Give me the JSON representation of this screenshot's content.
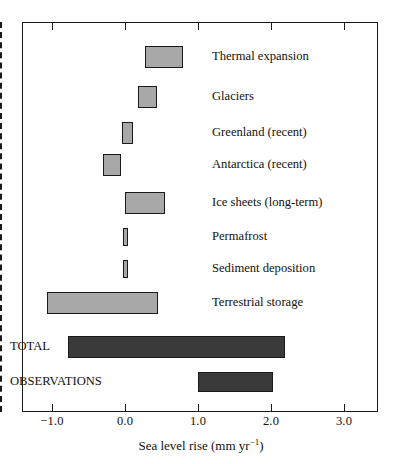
{
  "chart_data": {
    "type": "bar",
    "orientation": "horizontal",
    "subtype": "range-bars",
    "title": "",
    "xlabel": "Sea level rise (mm yr−1)",
    "ylabel": "",
    "xlim": [
      -1.45,
      3.45
    ],
    "xticks": [
      -1.0,
      0.0,
      1.0,
      2.0,
      3.0
    ],
    "xticklabels": [
      "−1.0",
      "0.0",
      "1.0",
      "2.0",
      "3.0"
    ],
    "grid": false,
    "legend": null,
    "zero_reference_line": {
      "value": 0.0,
      "style": "dashed"
    },
    "categories": [
      "Thermal expansion",
      "Glaciers",
      "Greenland (recent)",
      "Antarctica (recent)",
      "Ice sheets (long-term)",
      "Permafrost",
      "Sediment deposition",
      "Terrestrial storage",
      "TOTAL",
      "OBSERVATIONS"
    ],
    "bars": [
      {
        "label": "Thermal expansion",
        "low": 0.27,
        "high": 0.79,
        "color": "#a8a8a8",
        "label_position": "right"
      },
      {
        "label": "Glaciers",
        "low": 0.18,
        "high": 0.44,
        "color": "#a8a8a8",
        "label_position": "right"
      },
      {
        "label": "Greenland (recent)",
        "low": -0.04,
        "high": 0.11,
        "color": "#a8a8a8",
        "label_position": "right"
      },
      {
        "label": "Antarctica (recent)",
        "low": -0.3,
        "high": -0.05,
        "color": "#a8a8a8",
        "label_position": "right"
      },
      {
        "label": "Ice sheets (long-term)",
        "low": 0.0,
        "high": 0.55,
        "color": "#a8a8a8",
        "label_position": "right"
      },
      {
        "label": "Permafrost",
        "low": -0.03,
        "high": 0.04,
        "color": "#a8a8a8",
        "label_position": "right"
      },
      {
        "label": "Sediment deposition",
        "low": -0.03,
        "high": 0.04,
        "color": "#a8a8a8",
        "label_position": "right"
      },
      {
        "label": "Terrestrial storage",
        "low": -1.07,
        "high": 0.45,
        "color": "#a8a8a8",
        "label_position": "right"
      },
      {
        "label": "TOTAL",
        "low": -0.78,
        "high": 2.19,
        "color": "#3a3a3a",
        "label_position": "left"
      },
      {
        "label": "OBSERVATIONS",
        "low": 1.0,
        "high": 2.03,
        "color": "#3a3a3a",
        "label_position": "left"
      }
    ]
  },
  "axis": {
    "title_main": "Sea level rise (mm yr",
    "title_sup": "−1",
    "title_close": ")"
  }
}
